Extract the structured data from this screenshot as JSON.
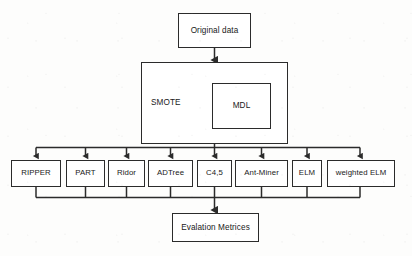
{
  "diagram": {
    "title": "Original data",
    "type": "flowchart",
    "colors": {
      "stroke": "#2b2b2b",
      "box_fill": "#ffffff",
      "background": "#fdfdfc",
      "text": "#191919"
    },
    "nodes": {
      "original_data": {
        "label": "Original data"
      },
      "smote": {
        "label": "SMOTE"
      },
      "mdl": {
        "label": "MDL"
      },
      "evaluation": {
        "label": "Evalation Metrices"
      }
    },
    "classifiers": [
      {
        "label": "RIPPER"
      },
      {
        "label": "PART"
      },
      {
        "label": "Ridor"
      },
      {
        "label": "ADTree"
      },
      {
        "label": "C4,5"
      },
      {
        "label": "Ant-Miner"
      },
      {
        "label": "ELM"
      },
      {
        "label": "weighted ELM"
      }
    ],
    "edges": [
      {
        "from": "original_data",
        "to": "smote",
        "style": "arrow-down"
      },
      {
        "from": "smote",
        "to": "classifier-bus",
        "style": "arrow-down"
      },
      {
        "from": "classifier-bus",
        "to": "RIPPER",
        "style": "arrow-down"
      },
      {
        "from": "classifier-bus",
        "to": "PART",
        "style": "arrow-down"
      },
      {
        "from": "classifier-bus",
        "to": "Ridor",
        "style": "arrow-down"
      },
      {
        "from": "classifier-bus",
        "to": "ADTree",
        "style": "arrow-down"
      },
      {
        "from": "classifier-bus",
        "to": "C4,5",
        "style": "arrow-down"
      },
      {
        "from": "classifier-bus",
        "to": "Ant-Miner",
        "style": "arrow-down"
      },
      {
        "from": "classifier-bus",
        "to": "ELM",
        "style": "arrow-down"
      },
      {
        "from": "classifier-bus",
        "to": "weighted ELM",
        "style": "arrow-down"
      },
      {
        "from": "classifiers",
        "to": "evaluation",
        "style": "merge-arrow-down"
      }
    ]
  }
}
